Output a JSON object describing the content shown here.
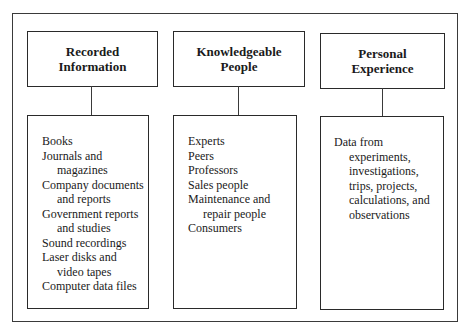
{
  "diagram": {
    "columns": [
      {
        "title_lines": [
          "Recorded",
          "Information"
        ],
        "items": [
          {
            "lines": [
              "Books"
            ]
          },
          {
            "lines": [
              "Journals and",
              "magazines"
            ]
          },
          {
            "lines": [
              "Company documents",
              "and reports"
            ]
          },
          {
            "lines": [
              "Government reports",
              "and studies"
            ]
          },
          {
            "lines": [
              "Sound recordings"
            ]
          },
          {
            "lines": [
              "Laser disks and",
              "video tapes"
            ]
          },
          {
            "lines": [
              "Computer data files"
            ]
          }
        ]
      },
      {
        "title_lines": [
          "Knowledgeable",
          "People"
        ],
        "items": [
          {
            "lines": [
              "Experts"
            ]
          },
          {
            "lines": [
              "Peers"
            ]
          },
          {
            "lines": [
              "Professors"
            ]
          },
          {
            "lines": [
              "Sales people"
            ]
          },
          {
            "lines": [
              "Maintenance and",
              "repair people"
            ]
          },
          {
            "lines": [
              "Consumers"
            ]
          }
        ]
      },
      {
        "title_lines": [
          "Personal",
          "Experience"
        ],
        "items": [
          {
            "lines": [
              "Data from",
              "experiments,",
              "investigations,",
              "trips, projects,",
              "calculations, and",
              "observations"
            ]
          }
        ]
      }
    ]
  }
}
